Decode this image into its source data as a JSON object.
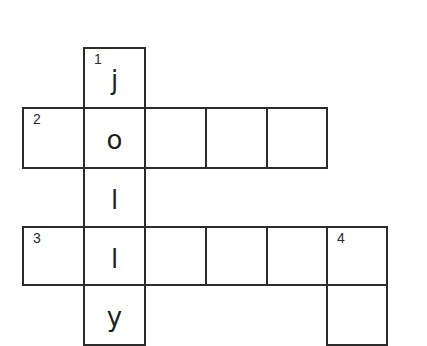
{
  "puzzle": {
    "title": "Crossword",
    "cells": [
      {
        "row": 1,
        "col": 2,
        "number": "1",
        "letter": "j"
      },
      {
        "row": 2,
        "col": 1,
        "number": "2",
        "letter": ""
      },
      {
        "row": 2,
        "col": 2,
        "number": "",
        "letter": "o"
      },
      {
        "row": 2,
        "col": 3,
        "number": "",
        "letter": ""
      },
      {
        "row": 2,
        "col": 4,
        "number": "",
        "letter": ""
      },
      {
        "row": 2,
        "col": 5,
        "number": "",
        "letter": ""
      },
      {
        "row": 3,
        "col": 2,
        "number": "",
        "letter": "l"
      },
      {
        "row": 4,
        "col": 1,
        "number": "3",
        "letter": ""
      },
      {
        "row": 4,
        "col": 2,
        "number": "",
        "letter": "l"
      },
      {
        "row": 4,
        "col": 3,
        "number": "",
        "letter": ""
      },
      {
        "row": 4,
        "col": 4,
        "number": "",
        "letter": ""
      },
      {
        "row": 4,
        "col": 5,
        "number": "",
        "letter": ""
      },
      {
        "row": 4,
        "col": 6,
        "number": "4",
        "letter": ""
      },
      {
        "row": 5,
        "col": 2,
        "number": "",
        "letter": "y"
      },
      {
        "row": 5,
        "col": 6,
        "number": "",
        "letter": ""
      }
    ],
    "clue_numbers": [
      "1",
      "2",
      "3",
      "4"
    ],
    "answer_1_down": "jolly"
  }
}
